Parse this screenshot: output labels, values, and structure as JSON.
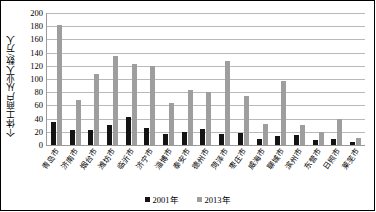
{
  "chart_data": {
    "type": "bar",
    "title": "",
    "xlabel": "",
    "ylabel": "个体工商户从业人数/万人",
    "ylim": [
      0,
      200
    ],
    "yticks": [
      200,
      180,
      160,
      140,
      120,
      100,
      80,
      60,
      40,
      20,
      0
    ],
    "grid": true,
    "legend_position": "bottom",
    "categories": [
      "青岛市",
      "济南市",
      "烟台市",
      "潍坊市",
      "临沂市",
      "济宁市",
      "淄博市",
      "泰安市",
      "德州市",
      "菏泽市",
      "枣庄市",
      "威海市",
      "聊城市",
      "滨州市",
      "东营市",
      "日照市",
      "莱芜市"
    ],
    "series": [
      {
        "name": "2001年",
        "color": "#141414",
        "values": [
          35,
          23,
          22,
          30,
          42,
          26,
          17,
          20,
          24,
          16,
          18,
          9,
          14,
          15,
          7,
          9,
          4
        ]
      },
      {
        "name": "2013年",
        "color": "#9e9e9e",
        "values": [
          182,
          68,
          108,
          135,
          122,
          120,
          63,
          84,
          81,
          127,
          75,
          32,
          97,
          31,
          19,
          39,
          11
        ]
      }
    ]
  }
}
